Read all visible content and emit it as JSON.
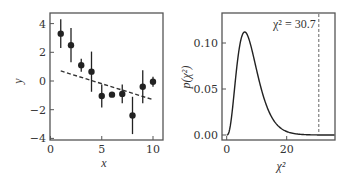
{
  "chart_data": [
    {
      "type": "scatter",
      "title": "",
      "xlabel": "x",
      "ylabel": "y",
      "xlim": [
        0,
        11
      ],
      "ylim": [
        -4.2,
        4.7
      ],
      "xticks": [
        0,
        5,
        10
      ],
      "xtick_labels": [
        "0",
        "5",
        "10"
      ],
      "yticks": [
        -4,
        -2,
        0,
        2,
        4
      ],
      "ytick_labels": [
        "−4",
        "−2",
        "0",
        "2",
        "4"
      ],
      "grid": false,
      "series": [
        {
          "name": "data",
          "style": "errorbar-points",
          "x": [
            1,
            2,
            3,
            4,
            5,
            6,
            7,
            8,
            9,
            10
          ],
          "y": [
            3.3,
            2.5,
            1.1,
            0.65,
            -1.05,
            -0.95,
            -0.9,
            -2.4,
            -0.4,
            -0.05
          ],
          "yerr": [
            1.0,
            1.2,
            0.45,
            1.4,
            0.8,
            0.15,
            0.65,
            1.3,
            1.15,
            0.35
          ]
        },
        {
          "name": "fit",
          "style": "dashed-line",
          "x": [
            1,
            10
          ],
          "y": [
            0.7,
            -1.3
          ]
        }
      ]
    },
    {
      "type": "line",
      "title": "",
      "xlabel": "χ²",
      "ylabel": "p(χ²)",
      "xlim": [
        -1.5,
        36
      ],
      "ylim": [
        -0.005,
        0.127
      ],
      "xticks": [
        0,
        20
      ],
      "xtick_labels": [
        "0",
        "20"
      ],
      "yticks": [
        0.0,
        0.05,
        0.1
      ],
      "ytick_labels": [
        "0.00",
        "0.05",
        "0.10"
      ],
      "grid": false,
      "series": [
        {
          "name": "chi-squared pdf (k=8)",
          "style": "solid-line",
          "degrees_of_freedom": 8,
          "x_range": [
            0,
            36
          ],
          "peak": {
            "x": 6,
            "y": 0.112
          }
        }
      ],
      "annotations": [
        {
          "text": "χ² = 30.7",
          "type": "vertical-dashed-line",
          "x": 30.7
        }
      ]
    }
  ]
}
